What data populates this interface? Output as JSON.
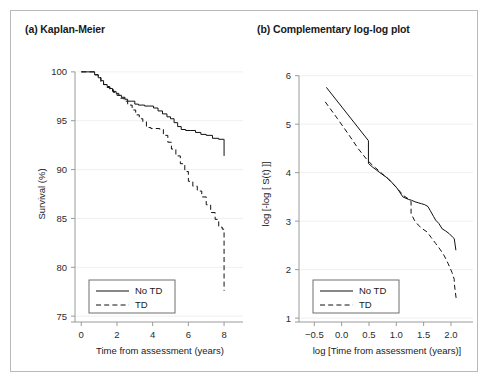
{
  "figure": {
    "panels": [
      {
        "id": "panel-a",
        "title": "(a) Kaplan-Meier",
        "legend": {
          "items": [
            {
              "label": "No TD",
              "style": "solid"
            },
            {
              "label": "TD",
              "style": "dashed"
            }
          ]
        }
      },
      {
        "id": "panel-b",
        "title": "(b) Complementary log-log plot",
        "legend": {
          "items": [
            {
              "label": "No TD",
              "style": "solid"
            },
            {
              "label": "TD",
              "style": "dashed"
            }
          ]
        }
      }
    ]
  },
  "chart_data": [
    {
      "type": "line",
      "title": "(a) Kaplan-Meier",
      "xlabel": "Time from assessment (years)",
      "ylabel": "Survival (%)",
      "xlim": [
        -0.35,
        8.5
      ],
      "ylim": [
        74.4,
        100.6
      ],
      "xticks": [
        0,
        2,
        4,
        6,
        8
      ],
      "xticklabels": [
        "0",
        "2",
        "4",
        "6",
        "8"
      ],
      "yticks": [
        75,
        80,
        85,
        90,
        95,
        100
      ],
      "yticklabels": [
        "75",
        "80",
        "85",
        "90",
        "95",
        "100"
      ],
      "grid": "horizontal",
      "legend_position": "bottom-left",
      "step": true,
      "series": [
        {
          "name": "No TD",
          "style": "solid",
          "x": [
            0.0,
            0.55,
            0.75,
            0.95,
            1.1,
            1.25,
            1.45,
            1.6,
            1.75,
            1.95,
            2.1,
            2.25,
            2.45,
            2.6,
            2.8,
            3.0,
            3.2,
            3.4,
            3.55,
            3.8,
            4.05,
            4.3,
            4.55,
            4.8,
            5.0,
            5.2,
            5.4,
            5.6,
            5.85,
            6.1,
            6.4,
            6.7,
            7.0,
            7.35,
            7.7,
            7.95,
            8.0
          ],
          "y": [
            100.0,
            100.0,
            99.7,
            99.4,
            99.1,
            98.7,
            98.5,
            98.3,
            98.0,
            97.8,
            97.6,
            97.4,
            97.2,
            97.0,
            97.0,
            96.7,
            96.6,
            96.6,
            96.5,
            96.5,
            96.3,
            96.0,
            95.7,
            95.4,
            95.2,
            94.8,
            94.4,
            94.1,
            94.0,
            94.0,
            93.8,
            93.6,
            93.5,
            93.2,
            93.1,
            93.1,
            91.4
          ]
        },
        {
          "name": "TD",
          "style": "dashed",
          "x": [
            0.0,
            0.55,
            0.75,
            0.95,
            1.1,
            1.25,
            1.45,
            1.6,
            1.8,
            2.0,
            2.2,
            2.4,
            2.6,
            2.85,
            3.05,
            3.25,
            3.45,
            3.65,
            3.9,
            4.15,
            4.4,
            4.6,
            4.85,
            5.05,
            5.3,
            5.55,
            5.8,
            6.0,
            6.25,
            6.5,
            6.75,
            7.0,
            7.25,
            7.5,
            7.7,
            7.9,
            8.0
          ],
          "y": [
            100.0,
            100.0,
            99.7,
            99.4,
            99.0,
            98.7,
            98.4,
            98.2,
            97.9,
            97.6,
            97.3,
            97.0,
            96.6,
            96.1,
            95.6,
            95.2,
            94.9,
            94.3,
            94.2,
            94.2,
            94.1,
            93.5,
            92.8,
            92.1,
            91.4,
            90.6,
            89.8,
            88.8,
            88.3,
            87.8,
            87.2,
            86.4,
            85.6,
            84.9,
            84.1,
            83.9,
            77.6
          ]
        }
      ]
    },
    {
      "type": "line",
      "title": "(b) Complementary log-log plot",
      "xlabel": "log [Time from assessment (years)]",
      "ylabel": "log [-log [ S(t) ]]",
      "xlim": [
        -0.78,
        2.22
      ],
      "ylim": [
        0.92,
        6.2
      ],
      "xticks": [
        -0.5,
        0.0,
        0.5,
        1.0,
        1.5,
        2.0
      ],
      "xticklabels": [
        "−0.5",
        "0.0",
        "0.5",
        "1.0",
        "1.5",
        "2.0"
      ],
      "yticks": [
        1,
        2,
        3,
        4,
        5,
        6
      ],
      "yticklabels": [
        "1",
        "2",
        "3",
        "4",
        "5",
        "6"
      ],
      "grid": "horizontal",
      "legend_position": "bottom-left",
      "step": false,
      "series": [
        {
          "name": "No TD",
          "style": "solid",
          "x": [
            -0.28,
            0.49,
            0.49,
            0.56,
            0.7,
            0.85,
            1.0,
            1.05,
            1.12,
            1.22,
            1.28,
            1.34,
            1.4,
            1.46,
            1.52,
            1.58,
            1.62,
            1.68,
            1.72,
            1.78,
            1.84,
            1.9,
            1.97,
            2.03,
            2.06,
            2.06,
            2.09
          ],
          "y": [
            5.76,
            4.66,
            4.19,
            4.12,
            4.0,
            3.88,
            3.7,
            3.62,
            3.5,
            3.45,
            3.43,
            3.4,
            3.38,
            3.36,
            3.34,
            3.3,
            3.22,
            3.1,
            3.02,
            2.95,
            2.84,
            2.8,
            2.74,
            2.67,
            2.64,
            2.64,
            2.4
          ]
        },
        {
          "name": "TD",
          "style": "dashed",
          "x": [
            -0.3,
            -0.08,
            0.12,
            0.3,
            0.44,
            0.52,
            0.62,
            0.74,
            0.86,
            0.98,
            1.06,
            1.14,
            1.22,
            1.27,
            1.27,
            1.33,
            1.4,
            1.48,
            1.56,
            1.64,
            1.72,
            1.8,
            1.88,
            1.95,
            2.02,
            2.06,
            2.06,
            2.1
          ],
          "y": [
            5.46,
            5.12,
            4.8,
            4.5,
            4.3,
            4.2,
            4.1,
            3.98,
            3.86,
            3.72,
            3.62,
            3.52,
            3.46,
            3.4,
            3.16,
            3.02,
            2.92,
            2.84,
            2.78,
            2.66,
            2.54,
            2.42,
            2.28,
            2.12,
            1.94,
            1.8,
            1.72,
            1.36
          ]
        }
      ]
    }
  ]
}
